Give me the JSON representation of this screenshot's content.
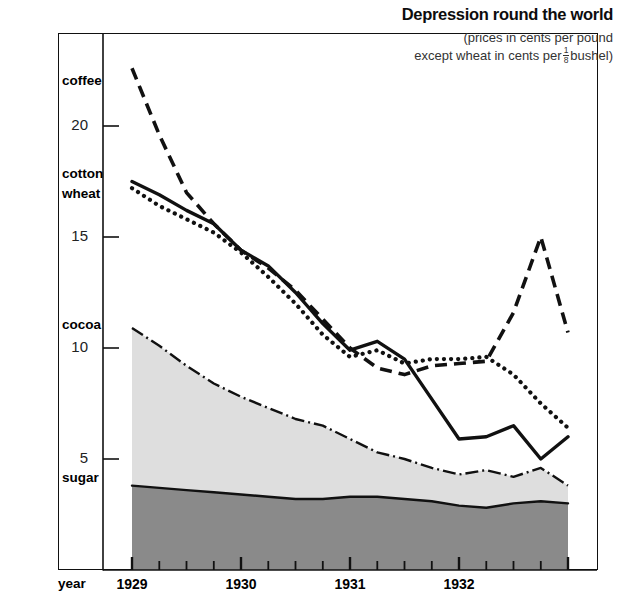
{
  "title": "Depression round the world",
  "subtitle_line1": "(prices in cents per pound",
  "subtitle_line2_pre": "except wheat in cents per",
  "subtitle_fraction_numerator": "1",
  "subtitle_fraction_denominator": "8",
  "subtitle_line2_post": "bushel)",
  "year_caption": "year",
  "colors": {
    "ink": "#111111",
    "band_cocoa_fill": "#d8d8d8",
    "band_sugar_fill": "#8a8a8a",
    "background": "#ffffff"
  },
  "chart_data": {
    "type": "line",
    "title": "Depression round the world",
    "subtitle": "(prices in cents per pound except wheat in cents per 1/8 bushel)",
    "xlabel": "year",
    "ylabel": "",
    "xlim": [
      1929.0,
      1933.0
    ],
    "ylim": [
      0,
      23.5
    ],
    "yticks": [
      5,
      10,
      15,
      20
    ],
    "ytick_labels": [
      "5",
      "10",
      "15",
      "20"
    ],
    "xticks": [
      1929,
      1930,
      1931,
      1932
    ],
    "xtick_labels": [
      "1929",
      "1930",
      "1931",
      "1932"
    ],
    "minor_xticks_per_year": 4,
    "grid": false,
    "legend_position": "inline-left-axis",
    "x": [
      1929.0,
      1929.25,
      1929.5,
      1929.75,
      1930.0,
      1930.25,
      1930.5,
      1930.75,
      1931.0,
      1931.25,
      1931.5,
      1931.75,
      1932.0,
      1932.25,
      1932.5,
      1932.75,
      1933.0
    ],
    "series": [
      {
        "name": "coffee",
        "style": "dashed",
        "values": [
          22.6,
          19.6,
          17.0,
          15.6,
          14.4,
          13.6,
          12.6,
          11.3,
          10.0,
          9.1,
          8.8,
          9.2,
          9.3,
          9.4,
          11.6,
          15.0,
          10.7
        ]
      },
      {
        "name": "cotton",
        "style": "solid",
        "values": [
          17.5,
          16.9,
          16.2,
          15.6,
          14.4,
          13.7,
          12.5,
          11.1,
          9.9,
          10.3,
          9.5,
          7.7,
          5.9,
          6.0,
          6.5,
          5.0,
          6.0
        ]
      },
      {
        "name": "wheat",
        "style": "dotted",
        "values": [
          17.2,
          16.4,
          15.8,
          15.2,
          14.3,
          13.2,
          12.0,
          10.6,
          9.6,
          9.9,
          9.3,
          9.5,
          9.5,
          9.6,
          8.8,
          7.5,
          6.4
        ]
      },
      {
        "name": "cocoa",
        "style": "dash-dot",
        "values": [
          10.9,
          10.1,
          9.2,
          8.4,
          7.8,
          7.3,
          6.8,
          6.5,
          5.9,
          5.3,
          5.0,
          4.6,
          4.3,
          4.5,
          4.2,
          4.6,
          3.8
        ]
      },
      {
        "name": "sugar",
        "style": "solid-filled",
        "values": [
          3.8,
          3.7,
          3.6,
          3.5,
          3.4,
          3.3,
          3.2,
          3.2,
          3.3,
          3.3,
          3.2,
          3.1,
          2.9,
          2.8,
          3.0,
          3.1,
          3.0
        ]
      }
    ],
    "series_labels": [
      {
        "name": "coffee",
        "label": "coffee",
        "y_at_axis": 22.0
      },
      {
        "name": "cotton",
        "label": "cotton",
        "y_at_axis": 17.8
      },
      {
        "name": "wheat",
        "label": "wheat",
        "y_at_axis": 16.9
      },
      {
        "name": "cocoa",
        "label": "cocoa",
        "y_at_axis": 11.0
      },
      {
        "name": "sugar",
        "label": "sugar",
        "y_at_axis": 4.1
      }
    ]
  }
}
